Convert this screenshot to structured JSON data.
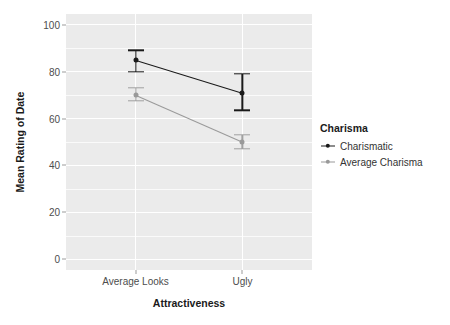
{
  "chart_data": {
    "type": "line",
    "title": "",
    "xlabel": "Attractiveness",
    "ylabel": "Mean Rating of Date",
    "categories": [
      "Average Looks",
      "Ugly"
    ],
    "ylim": [
      0,
      100
    ],
    "yticks": [
      0,
      20,
      40,
      60,
      80,
      100
    ],
    "ytick_labels": [
      "0",
      "20",
      "40",
      "60",
      "80",
      "100"
    ],
    "grid": true,
    "grid_color": "#ffffff",
    "panel_color": "#ebebeb",
    "legend_position": "right",
    "legend_title": "Charisma",
    "series": [
      {
        "name": "Charismatic",
        "color": "#1a1a1a",
        "values": [
          85,
          71
        ],
        "error_low": [
          80,
          63.5
        ],
        "error_high": [
          89,
          79
        ]
      },
      {
        "name": "Average Charisma",
        "color": "#999999",
        "values": [
          70,
          50
        ],
        "error_low": [
          67.5,
          47
        ],
        "error_high": [
          73,
          53
        ]
      }
    ]
  },
  "axes": {
    "y_title": "Mean Rating of Date",
    "x_title": "Attractiveness"
  },
  "legend": {
    "title": "Charisma",
    "entries": [
      {
        "label": "Charismatic",
        "key": "line-point-key-dark"
      },
      {
        "label": "Average Charisma",
        "key": "line-point-key-gray"
      }
    ]
  }
}
